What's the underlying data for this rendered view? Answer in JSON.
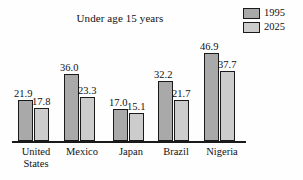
{
  "chart_data": {
    "type": "bar",
    "title": "Under age 15 years",
    "xlabel": "",
    "ylabel": "",
    "ylim": [
      0,
      50
    ],
    "grid": false,
    "legend_position": "top-right",
    "categories": [
      "United States",
      "Mexico",
      "Japan",
      "Brazil",
      "Nigeria"
    ],
    "category_lines": [
      [
        "United",
        "States"
      ],
      [
        "Mexico"
      ],
      [
        "Japan"
      ],
      [
        "Brazil"
      ],
      [
        "Nigeria"
      ]
    ],
    "series": [
      {
        "name": "1995",
        "color": "#a9a9a9",
        "values": [
          21.9,
          36.0,
          17.0,
          32.2,
          46.9
        ],
        "labels": [
          "21.9",
          "36.0",
          "17.0",
          "32.2",
          "46.9"
        ]
      },
      {
        "name": "2025",
        "color": "#cccccc",
        "values": [
          17.8,
          23.3,
          15.1,
          21.7,
          37.7
        ],
        "labels": [
          "17.8",
          "23.3",
          "15.1",
          "21.7",
          "37.7"
        ]
      }
    ]
  },
  "legend": {
    "items": [
      {
        "label": "1995",
        "color": "#a9a9a9"
      },
      {
        "label": "2025",
        "color": "#cccccc"
      }
    ]
  }
}
